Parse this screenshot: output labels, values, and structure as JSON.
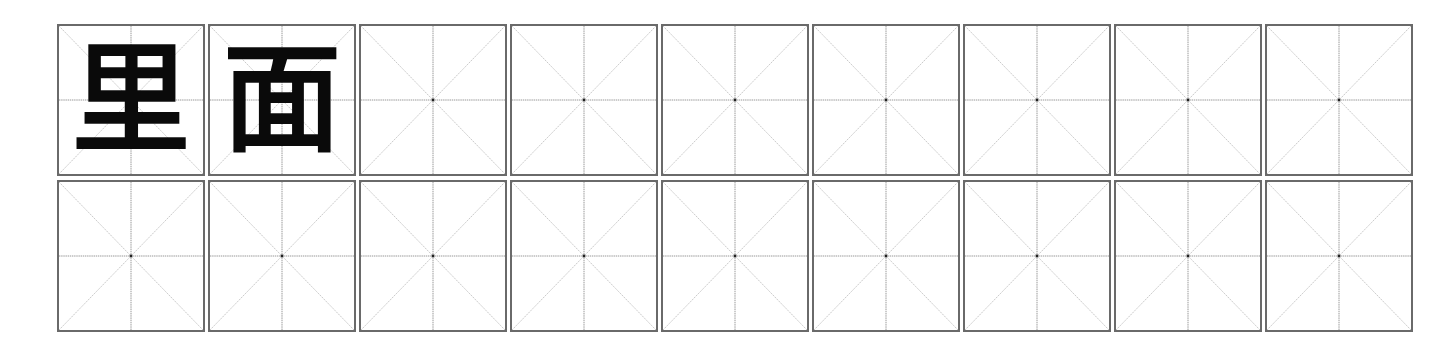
{
  "worksheet": {
    "grid_type": "mi-zi-ge",
    "columns": 9,
    "rows": 2,
    "line_color": "#6a6a6a",
    "guide_color": "#b0b0b0",
    "ink_color": "#0a0a0a",
    "cells": [
      {
        "char": "里"
      },
      {
        "char": "面"
      },
      {
        "char": ""
      },
      {
        "char": ""
      },
      {
        "char": ""
      },
      {
        "char": ""
      },
      {
        "char": ""
      },
      {
        "char": ""
      },
      {
        "char": ""
      },
      {
        "char": ""
      },
      {
        "char": ""
      },
      {
        "char": ""
      },
      {
        "char": ""
      },
      {
        "char": ""
      },
      {
        "char": ""
      },
      {
        "char": ""
      },
      {
        "char": ""
      },
      {
        "char": ""
      }
    ]
  }
}
